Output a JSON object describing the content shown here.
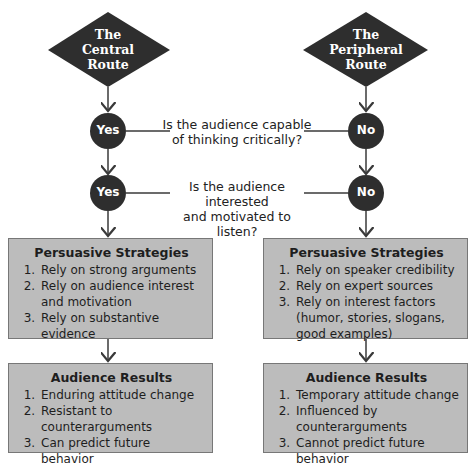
{
  "routes": {
    "central": {
      "title_lines": [
        "The",
        "Central",
        "Route"
      ],
      "answers": [
        "Yes",
        "Yes"
      ],
      "strategies": {
        "heading": "Persuasive Strategies",
        "items": [
          "Rely on strong arguments",
          "Rely on audience interest and motivation",
          "Rely on substantive evidence"
        ]
      },
      "results": {
        "heading": "Audience Results",
        "items": [
          "Enduring attitude change",
          "Resistant to counterarguments",
          "Can predict future behavior"
        ]
      }
    },
    "peripheral": {
      "title_lines": [
        "The",
        "Peripheral",
        "Route"
      ],
      "answers": [
        "No",
        "No"
      ],
      "strategies": {
        "heading": "Persuasive Strategies",
        "items": [
          "Rely on speaker credibility",
          "Rely on expert sources",
          "Rely on interest factors (humor, stories, slogans, good examples)"
        ]
      },
      "results": {
        "heading": "Audience Results",
        "items": [
          "Temporary attitude change",
          "Influenced by counterarguments",
          "Cannot predict future behavior"
        ]
      }
    }
  },
  "questions": [
    {
      "lines": [
        "Is the audience capable",
        "of thinking critically?"
      ]
    },
    {
      "lines": [
        "Is the audience interested",
        "and motivated to listen?"
      ]
    }
  ],
  "colors": {
    "node_fill": "#2e2e2e",
    "box_fill": "#bcbcbc",
    "line": "#3a3a3a"
  }
}
